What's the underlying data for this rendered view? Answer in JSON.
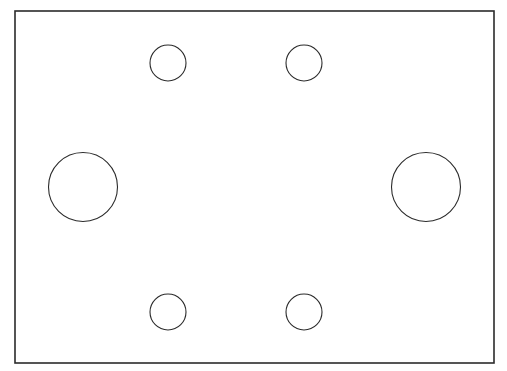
{
  "drawing": {
    "background": "#ffffff",
    "stroke_color": "#2b2b2b",
    "plate": {
      "x": 15,
      "y": 11,
      "width": 479,
      "height": 352,
      "stroke_width": 1.6
    },
    "holes": [
      {
        "id": "small-top-left",
        "cx": 168,
        "cy": 63,
        "r": 18
      },
      {
        "id": "small-top-right",
        "cx": 304,
        "cy": 63,
        "r": 18
      },
      {
        "id": "large-left",
        "cx": 83,
        "cy": 187,
        "r": 34.5
      },
      {
        "id": "large-right",
        "cx": 426,
        "cy": 187,
        "r": 34.5
      },
      {
        "id": "small-bottom-left",
        "cx": 168,
        "cy": 312,
        "r": 18
      },
      {
        "id": "small-bottom-right",
        "cx": 304,
        "cy": 312,
        "r": 18
      }
    ],
    "hole_stroke_width": 1.1
  }
}
